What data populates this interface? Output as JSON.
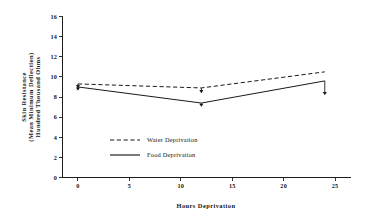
{
  "chart_data": {
    "type": "line",
    "title": "",
    "xlabel": "Hours Deprivation",
    "ylabel": "Skin Resistance (Mean Minimum Deflection) Hundred Thousand Ohms",
    "ylabel_lines": [
      "Skin Resistance",
      "(Mean Minimum Deflection)",
      "Hundred Thousand Ohms"
    ],
    "x": [
      0,
      12,
      24
    ],
    "xlim": [
      -1.5,
      26.5
    ],
    "ylim": [
      0,
      16
    ],
    "xticks": [
      0,
      5,
      10,
      15,
      20,
      25
    ],
    "xtick_labels": [
      "0",
      "5",
      "10",
      "15",
      "20",
      "25"
    ],
    "yticks": [
      0,
      2,
      4,
      6,
      8,
      10,
      12,
      14,
      16
    ],
    "ytick_labels": [
      "0",
      "2",
      "4",
      "6",
      "8",
      "10",
      "12",
      "14",
      "16"
    ],
    "grid": false,
    "legend_position": "inside-center-lower",
    "series": [
      {
        "name": "Water Deprivation",
        "style": "dashed",
        "values": [
          9.3,
          8.9,
          10.5
        ],
        "error_low": [
          0.35,
          0.45,
          0.0
        ]
      },
      {
        "name": "Food Deprivation",
        "style": "solid",
        "values": [
          9.0,
          7.4,
          9.6
        ],
        "error_low": [
          0.3,
          0.3,
          1.35
        ]
      }
    ]
  },
  "legend": {
    "entries": [
      {
        "label": "Water Deprivation",
        "style": "dashed"
      },
      {
        "label": "Food Deprivation",
        "style": "solid"
      }
    ]
  },
  "colors": {
    "ink": "#1a1a1a",
    "background": "#ffffff"
  }
}
